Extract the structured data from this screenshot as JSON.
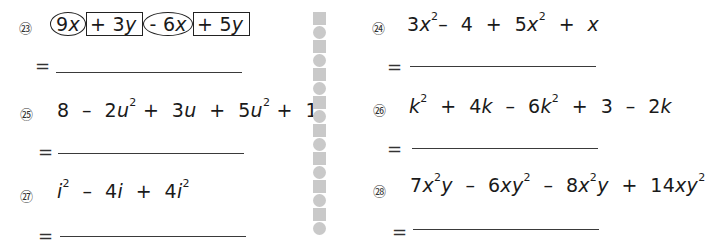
{
  "equals_sign": "=",
  "problems": [
    {
      "number": "㉓",
      "terms": [
        {
          "text": "9x",
          "coef": "9",
          "var": "x",
          "mark": "circle"
        },
        {
          "text": "+ 3y",
          "coef": "+ 3",
          "var": "y",
          "mark": "box"
        },
        {
          "text": "- 6x",
          "coef": "- 6",
          "var": "x",
          "mark": "circle"
        },
        {
          "text": "+ 5y",
          "coef": "+ 5",
          "var": "y",
          "mark": "box"
        }
      ]
    },
    {
      "number": "㉔",
      "expression": "3x² - 4 + 5x² + x"
    },
    {
      "number": "㉕",
      "expression": "8 - 2u² + 3u + 5u² + 1"
    },
    {
      "number": "㉖",
      "expression": "k² + 4k - 6k² + 3 - 2k"
    },
    {
      "number": "㉗",
      "expression": "i² - 4i + 4i²"
    },
    {
      "number": "㉘",
      "expression": "7x²y - 6xy² - 8x²y + 14xy²"
    }
  ],
  "divider_pattern": [
    "square",
    "circle",
    "square",
    "circle",
    "square",
    "circle",
    "square",
    "circle",
    "square",
    "circle",
    "square",
    "circle",
    "square",
    "circle",
    "square",
    "circle"
  ],
  "colors": {
    "text": "#1a1a1a",
    "divider": "#c9c9c9"
  }
}
